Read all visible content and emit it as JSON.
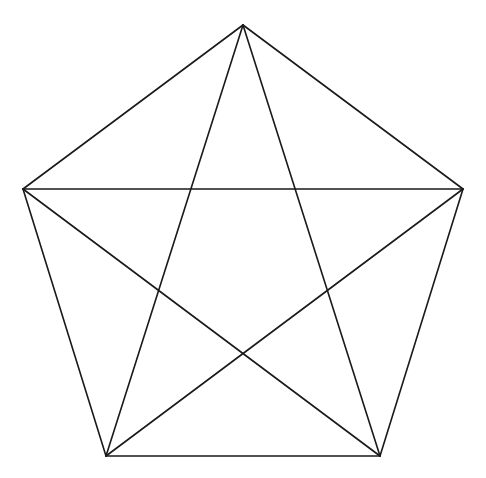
{
  "diagram": {
    "type": "pentagon-with-pentagram",
    "background": "#ffffff",
    "stroke": "#1a1a1a",
    "stroke_width": 1.6,
    "vertices": [
      {
        "name": "top",
        "x": 243,
        "y": 25
      },
      {
        "name": "right",
        "x": 463,
        "y": 189
      },
      {
        "name": "bottom-right",
        "x": 380,
        "y": 456
      },
      {
        "name": "bottom-left",
        "x": 106,
        "y": 456
      },
      {
        "name": "left",
        "x": 23,
        "y": 189
      }
    ],
    "pentagon_edges": [
      [
        0,
        1
      ],
      [
        1,
        2
      ],
      [
        2,
        3
      ],
      [
        3,
        4
      ],
      [
        4,
        0
      ]
    ],
    "star_diagonals": [
      [
        0,
        2
      ],
      [
        0,
        3
      ],
      [
        1,
        3
      ],
      [
        1,
        4
      ],
      [
        2,
        4
      ]
    ]
  }
}
